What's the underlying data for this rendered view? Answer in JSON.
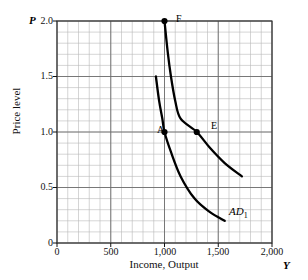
{
  "chart_data": {
    "type": "line",
    "title": "",
    "xlabel": "Income, Output",
    "ylabel": "Price level",
    "x_axis_symbol": "Y",
    "y_axis_symbol": "P",
    "xlim": [
      0,
      2000
    ],
    "ylim": [
      0,
      2.0
    ],
    "grid": true,
    "grid_minor_x": 100,
    "grid_minor_y": 0.1,
    "xticks": [
      0,
      500,
      1000,
      1500,
      2000
    ],
    "xtick_labels": [
      "0",
      "500",
      "1,000",
      "1,500",
      "2,000"
    ],
    "yticks": [
      0,
      0.5,
      1.0,
      1.5,
      2.0
    ],
    "ytick_labels": [
      "0",
      "0.5",
      "1.0",
      "1.5",
      "2.0"
    ],
    "legend_position": "inline-annotation",
    "series": [
      {
        "name": "AD0",
        "label": "",
        "points": [
          [
            920,
            1.5
          ],
          [
            950,
            1.28
          ],
          [
            980,
            1.12
          ],
          [
            1000,
            1.0
          ],
          [
            1060,
            0.82
          ],
          [
            1150,
            0.6
          ],
          [
            1280,
            0.4
          ],
          [
            1420,
            0.28
          ],
          [
            1560,
            0.2
          ]
        ]
      },
      {
        "name": "AD1",
        "label": "AD",
        "label_subscript": "1",
        "points": [
          [
            1000,
            2.0
          ],
          [
            1030,
            1.72
          ],
          [
            1060,
            1.5
          ],
          [
            1100,
            1.28
          ],
          [
            1150,
            1.12
          ],
          [
            1300,
            1.0
          ],
          [
            1420,
            0.86
          ],
          [
            1560,
            0.72
          ],
          [
            1720,
            0.6
          ]
        ]
      }
    ],
    "annotations": [
      {
        "label": "F",
        "x": 1000,
        "y": 2.0,
        "marker": "dot",
        "series": "AD1"
      },
      {
        "label": "A",
        "x": 1000,
        "y": 1.0,
        "marker": "dot",
        "series": "AD0"
      },
      {
        "label": "E",
        "x": 1300,
        "y": 1.0,
        "marker": "dot",
        "series": "AD1"
      },
      {
        "label": "AD1",
        "x": 1620,
        "y": 0.23,
        "marker": "none",
        "series": "AD1"
      }
    ],
    "colors": {
      "curve": "#000000",
      "grid_minor": "#b9b9b9",
      "grid_major": "#6d6d6d",
      "axis": "#111111",
      "background": "#ffffff"
    }
  },
  "labels": {
    "y_symbol": "P",
    "x_symbol": "Y",
    "y_axis_title": "Price level",
    "x_axis_title": "Income, Output",
    "ytick_2_0": "2.0",
    "ytick_1_5": "1.5",
    "ytick_1_0": "1.0",
    "ytick_0_5": "0.5",
    "ytick_0": "0",
    "xtick_0": "0",
    "xtick_500": "500",
    "xtick_1000": "1,000",
    "xtick_1500": "1,500",
    "xtick_2000": "2,000",
    "point_F": "F",
    "point_A": "A",
    "point_E": "E",
    "curve_label_ad": "AD",
    "curve_label_ad_sub": "1"
  }
}
